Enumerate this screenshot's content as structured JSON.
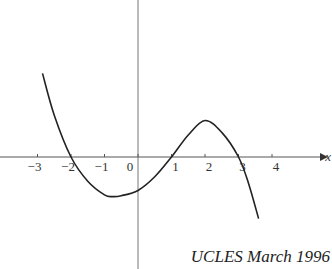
{
  "chart_data": {
    "type": "line",
    "title": "",
    "xlabel": "x",
    "ylabel": "",
    "xlim": [
      -3.8,
      4.9
    ],
    "xticks": [
      -3,
      -2,
      -1,
      0,
      1,
      2,
      3,
      4
    ],
    "xtick_labels": [
      "−3",
      "−2",
      "−1",
      "0",
      "1",
      "2",
      "3",
      "4"
    ],
    "series": [
      {
        "name": "curve",
        "x": [
          -2.85,
          -2.5,
          -2,
          -1.5,
          -1,
          -0.75,
          -0.5,
          0,
          0.5,
          1,
          1.5,
          2,
          2.5,
          3,
          3.3,
          3.6
        ],
        "y": [
          19,
          9.5,
          0,
          -5.5,
          -8.6,
          -9,
          -8.8,
          -7.6,
          -4.5,
          0,
          5,
          8.3,
          5.6,
          0,
          -6,
          -14
        ]
      }
    ],
    "grid": false,
    "annotation": "UCLES March 1996"
  }
}
